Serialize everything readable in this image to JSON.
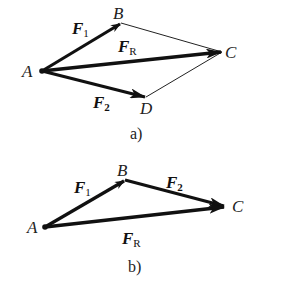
{
  "figure_a": {
    "caption": "a)",
    "points": {
      "A": {
        "label": "A",
        "x": 42,
        "y": 71
      },
      "B": {
        "label": "B",
        "x": 121,
        "y": 23
      },
      "C": {
        "label": "C",
        "x": 222,
        "y": 52
      },
      "D": {
        "label": "D",
        "x": 146,
        "y": 97
      }
    },
    "vectors": [
      {
        "name": "F",
        "sub": "1",
        "from": "A",
        "to": "B"
      },
      {
        "name": "F",
        "sub": "R",
        "from": "A",
        "to": "C"
      },
      {
        "name": "F",
        "sub": "2",
        "from": "A",
        "to": "D"
      }
    ],
    "construction_lines": [
      [
        "B",
        "C"
      ],
      [
        "D",
        "C"
      ]
    ]
  },
  "figure_b": {
    "caption": "b)",
    "points": {
      "A": {
        "label": "A",
        "x": 45,
        "y": 227
      },
      "B": {
        "label": "B",
        "x": 125,
        "y": 180
      },
      "C": {
        "label": "C",
        "x": 225,
        "y": 206
      }
    },
    "vectors": [
      {
        "name": "F",
        "sub": "1",
        "from": "A",
        "to": "B"
      },
      {
        "name": "F",
        "sub": "2",
        "from": "B",
        "to": "C"
      },
      {
        "name": "F",
        "sub": "R",
        "from": "A",
        "to": "C"
      }
    ]
  },
  "colors": {
    "stroke": "#111111",
    "thin": "#222222",
    "background": "#ffffff"
  }
}
